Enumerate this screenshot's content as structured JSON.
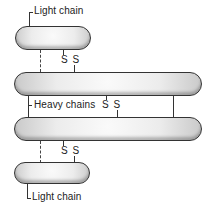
{
  "diagram": {
    "labels": {
      "light_chain_top": "Light chain",
      "heavy_chains": "Heavy chains",
      "light_chain_bottom": "Light chain"
    },
    "disulfide_bonds": [
      {
        "id": "light-heavy-top",
        "text": "S S"
      },
      {
        "id": "heavy-heavy",
        "text": "S S"
      },
      {
        "id": "light-heavy-bottom",
        "text": "S S"
      }
    ],
    "chains": [
      {
        "id": "light-chain-top",
        "type": "light"
      },
      {
        "id": "heavy-chain-1",
        "type": "heavy"
      },
      {
        "id": "heavy-chain-2",
        "type": "heavy"
      },
      {
        "id": "light-chain-bottom",
        "type": "light"
      }
    ],
    "colors": {
      "outline": "#333333",
      "fill": "#ececec",
      "background": "#ffffff"
    }
  }
}
